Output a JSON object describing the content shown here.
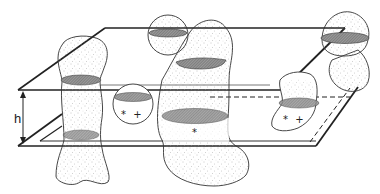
{
  "diagram": {
    "type": "3d-schematic",
    "dimension_label": "h",
    "markers": {
      "small_sphere": "* +",
      "central_body": "*",
      "right_body": "* +"
    },
    "colors": {
      "line": "#222222",
      "stipple": "#9a9a9a",
      "hatch": "#8c8c8c",
      "background": "#ffffff"
    }
  }
}
